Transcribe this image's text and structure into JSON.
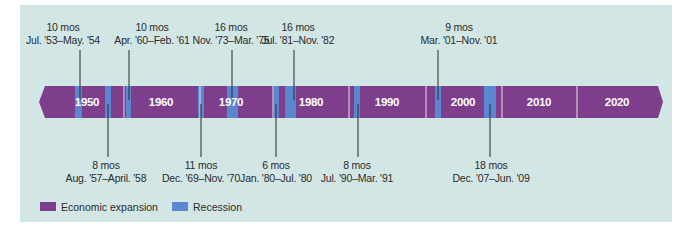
{
  "colors": {
    "panel_bg": "#d3e6e6",
    "expansion": "#7d3e8c",
    "recession": "#5b86d0",
    "divider": "#e9dcef",
    "connector": "#2b2b2b"
  },
  "decades": [
    {
      "label": "1950",
      "x": 87
    },
    {
      "label": "1960",
      "x": 161
    },
    {
      "label": "1970",
      "x": 231
    },
    {
      "label": "1980",
      "x": 311
    },
    {
      "label": "1990",
      "x": 387
    },
    {
      "label": "2000",
      "x": 463
    },
    {
      "label": "2010",
      "x": 539
    },
    {
      "label": "2020",
      "x": 617
    }
  ],
  "recessions": [
    {
      "duration": "10 mos",
      "period": "Jul. '53–May. '54",
      "x0": 75,
      "x1": 82,
      "pos": "top",
      "line_x": 80,
      "label_x": 63
    },
    {
      "duration": "8 mos",
      "period": "Aug. '57–April. '58",
      "x0": 105,
      "x1": 111,
      "pos": "bottom",
      "line_x": 108,
      "label_x": 106
    },
    {
      "duration": "10 mos",
      "period": "Apr. '60–Feb. '61",
      "x0": 126,
      "x1": 131,
      "pos": "top",
      "line_x": 129,
      "label_x": 152
    },
    {
      "duration": "11 mos",
      "period": "Dec. '69–Nov. '70",
      "x0": 198,
      "x1": 204,
      "pos": "bottom",
      "line_x": 201,
      "label_x": 201
    },
    {
      "duration": "16 mos",
      "period": "Nov. '73–Mar. '75",
      "x0": 227,
      "x1": 238,
      "pos": "top",
      "line_x": 232,
      "label_x": 231
    },
    {
      "duration": "6 mos",
      "period": "Jan. '80–Jul. '80",
      "x0": 274,
      "x1": 279,
      "pos": "bottom",
      "line_x": 276,
      "label_x": 276
    },
    {
      "duration": "16 mos",
      "period": "Jul. '81–Nov. '82",
      "x0": 285,
      "x1": 296,
      "pos": "top",
      "line_x": 294,
      "label_x": 298
    },
    {
      "duration": "8 mos",
      "period": "Jul. '90–Mar. '91",
      "x0": 354,
      "x1": 360,
      "pos": "bottom",
      "line_x": 358,
      "label_x": 357
    },
    {
      "duration": "9 mos",
      "period": "Mar. '01–Nov. '01",
      "x0": 435,
      "x1": 441,
      "pos": "top",
      "line_x": 438,
      "label_x": 459
    },
    {
      "duration": "18 mos",
      "period": "Dec. '07–Jun. '09",
      "x0": 484,
      "x1": 496,
      "pos": "bottom",
      "line_x": 490,
      "label_x": 491
    }
  ],
  "legend": {
    "expansion_label": "Economic expansion",
    "recession_label": "Recession"
  },
  "chart_data": {
    "type": "timeline",
    "title": "",
    "x_range": [
      1945,
      2030
    ],
    "categories": [
      "1950",
      "1960",
      "1970",
      "1980",
      "1990",
      "2000",
      "2010",
      "2020"
    ],
    "series": [
      {
        "name": "Recession",
        "items": [
          {
            "start": "Jul. 1953",
            "end": "May 1954",
            "months": 10
          },
          {
            "start": "Aug. 1957",
            "end": "Apr. 1958",
            "months": 8
          },
          {
            "start": "Apr. 1960",
            "end": "Feb. 1961",
            "months": 10
          },
          {
            "start": "Dec. 1969",
            "end": "Nov. 1970",
            "months": 11
          },
          {
            "start": "Nov. 1973",
            "end": "Mar. 1975",
            "months": 16
          },
          {
            "start": "Jan. 1980",
            "end": "Jul. 1980",
            "months": 6
          },
          {
            "start": "Jul. 1981",
            "end": "Nov. 1982",
            "months": 16
          },
          {
            "start": "Jul. 1990",
            "end": "Mar. 1991",
            "months": 8
          },
          {
            "start": "Mar. 2001",
            "end": "Nov. 2001",
            "months": 9
          },
          {
            "start": "Dec. 2007",
            "end": "Jun. 2009",
            "months": 18
          }
        ]
      },
      {
        "name": "Economic expansion",
        "items": "all other periods"
      }
    ],
    "legend": [
      "Economic expansion",
      "Recession"
    ],
    "legend_position": "bottom-left"
  }
}
